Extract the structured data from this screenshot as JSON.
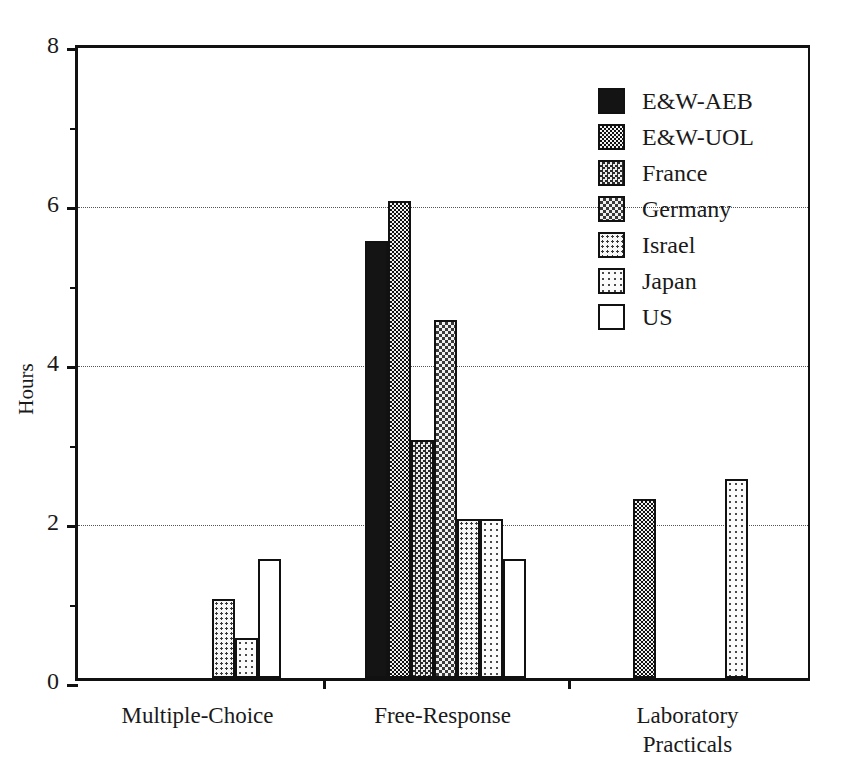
{
  "chart_data": {
    "type": "bar",
    "title": "",
    "xlabel": "",
    "ylabel": "Hours",
    "ylim": [
      0,
      8
    ],
    "yticks": [
      0,
      2,
      4,
      6,
      8
    ],
    "ytick_labels": [
      "0",
      "2",
      "4",
      "6",
      "8"
    ],
    "yminor_ticks": [
      1,
      3,
      5,
      7
    ],
    "gridlines": [
      2,
      4,
      6
    ],
    "grid": "horizontal-dotted",
    "legend_position": "upper-right-inside",
    "categories": [
      "Multiple-Choice",
      "Free-Response",
      "Laboratory\nPracticals"
    ],
    "series": [
      {
        "name": "E&W-AEB",
        "values": [
          null,
          5.5,
          null
        ],
        "pattern": "solid-black"
      },
      {
        "name": "E&W-UOL",
        "values": [
          null,
          6.0,
          2.25
        ],
        "pattern": "dense-checker"
      },
      {
        "name": "France",
        "values": [
          null,
          3.0,
          null
        ],
        "pattern": "medium-checker"
      },
      {
        "name": "Germany",
        "values": [
          null,
          4.5,
          null
        ],
        "pattern": "light-checker"
      },
      {
        "name": "Israel",
        "values": [
          1.0,
          2.0,
          null
        ],
        "pattern": "medium-dots"
      },
      {
        "name": "Japan",
        "values": [
          0.5,
          2.0,
          2.5
        ],
        "pattern": "sparse-dots"
      },
      {
        "name": "US",
        "values": [
          1.5,
          1.5,
          null
        ],
        "pattern": "white"
      }
    ]
  },
  "legend": {
    "items": [
      {
        "label": "E&W-AEB"
      },
      {
        "label": "E&W-UOL"
      },
      {
        "label": "France"
      },
      {
        "label": "Germany"
      },
      {
        "label": "Israel"
      },
      {
        "label": "Japan"
      },
      {
        "label": "US"
      }
    ]
  },
  "axis": {
    "y_title": "Hours",
    "y_labels": [
      "8",
      "6",
      "4",
      "2",
      "0"
    ]
  }
}
